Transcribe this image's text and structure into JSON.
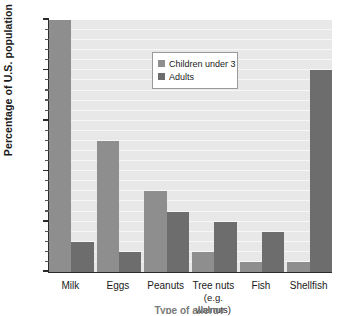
{
  "chart_data": {
    "type": "bar",
    "title": "",
    "xlabel": "Type of allergy",
    "ylabel": "Percentage of U.S. population",
    "categories": [
      "Milk",
      "Eggs",
      "Peanuts",
      "Tree nuts (e.g. walnuts)",
      "Fish",
      "Shellfish"
    ],
    "category_labels": [
      {
        "line1": "Milk",
        "line2": ""
      },
      {
        "line1": "Eggs",
        "line2": ""
      },
      {
        "line1": "Peanuts",
        "line2": ""
      },
      {
        "line1": "Tree nuts",
        "line2": "(e.g. walnuts)"
      },
      {
        "line1": "Fish",
        "line2": ""
      },
      {
        "line1": "Shellfish",
        "line2": ""
      }
    ],
    "series": [
      {
        "name": "Children under 3",
        "color": "#8e8e8e",
        "values": [
          2.5,
          1.3,
          0.8,
          0.2,
          0.1,
          0.1
        ]
      },
      {
        "name": "Adults",
        "color": "#6d6d6d",
        "values": [
          0.3,
          0.2,
          0.6,
          0.5,
          0.4,
          2.0
        ]
      }
    ],
    "ylim": [
      0,
      2.5
    ],
    "ytick_labels": [
      "0",
      "0.5",
      "1",
      "1.5",
      "2",
      "2.5"
    ],
    "ytick_values": [
      0,
      0.5,
      1,
      1.5,
      2,
      2.5
    ],
    "yminor_step": 0.1,
    "grid": true,
    "grid_orientation": "horizontal",
    "legend_position": "top-center",
    "plot_background": "#e8e8e8",
    "axis_color": "#2b2b2b"
  },
  "legend": {
    "items": [
      {
        "label": "Children under 3"
      },
      {
        "label": "Adults"
      }
    ]
  }
}
